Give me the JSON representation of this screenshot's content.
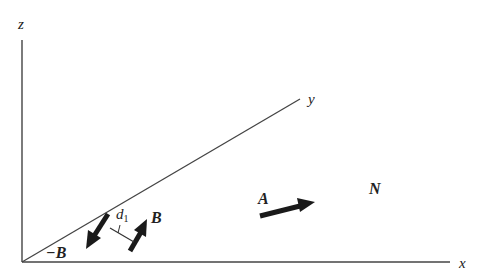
{
  "diagram": {
    "axes": {
      "z": {
        "label": "z"
      },
      "x": {
        "label": "x"
      },
      "y": {
        "label": "y"
      }
    },
    "vectors": {
      "A": {
        "label": "A"
      },
      "B": {
        "label": "B"
      },
      "neg_B": {
        "label": "−B"
      }
    },
    "separation": {
      "label": "d",
      "subscript": "1"
    },
    "region": {
      "label": "N"
    },
    "colors": {
      "line": "#444444",
      "arrow": "#1a1a1a",
      "text": "#222222",
      "background": "#ffffff"
    }
  }
}
